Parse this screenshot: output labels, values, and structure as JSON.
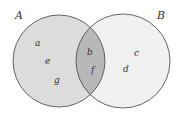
{
  "diagram": {
    "type": "venn",
    "sets": [
      {
        "name": "A",
        "elements_only": [
          "a",
          "e",
          "g"
        ],
        "fill": "#dcdcdc"
      },
      {
        "name": "B",
        "elements_only": [
          "c",
          "d"
        ],
        "fill": "#f0f0f0"
      }
    ],
    "intersection": {
      "elements": [
        "b",
        "f"
      ],
      "fill": "#b8b8b8"
    },
    "labels": {
      "setA": "A",
      "setB": "B",
      "a": "a",
      "e": "e",
      "g": "g",
      "b": "b",
      "f": "f",
      "c": "c",
      "d": "d"
    },
    "stroke": "#555555"
  }
}
